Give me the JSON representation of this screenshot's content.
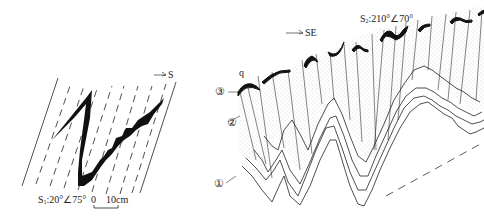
{
  "left_panel": {
    "direction_label": "S",
    "attitude_label": "S₁:20°∠75°",
    "attitude_prefix": "S",
    "attitude_sub": "1",
    "attitude_value": ":20°∠75°",
    "scale_zero": "0",
    "scale_length": "10cm"
  },
  "right_panel": {
    "direction_label": "SE",
    "attitude_prefix": "S",
    "attitude_sub": "2",
    "attitude_value": ":210°∠70°",
    "vein_label": "q",
    "layer_labels": [
      "①",
      "②",
      "③"
    ]
  },
  "colors": {
    "ink": "#1a1a1a",
    "stipple": "#e4e4e4",
    "background": "#ffffff"
  }
}
